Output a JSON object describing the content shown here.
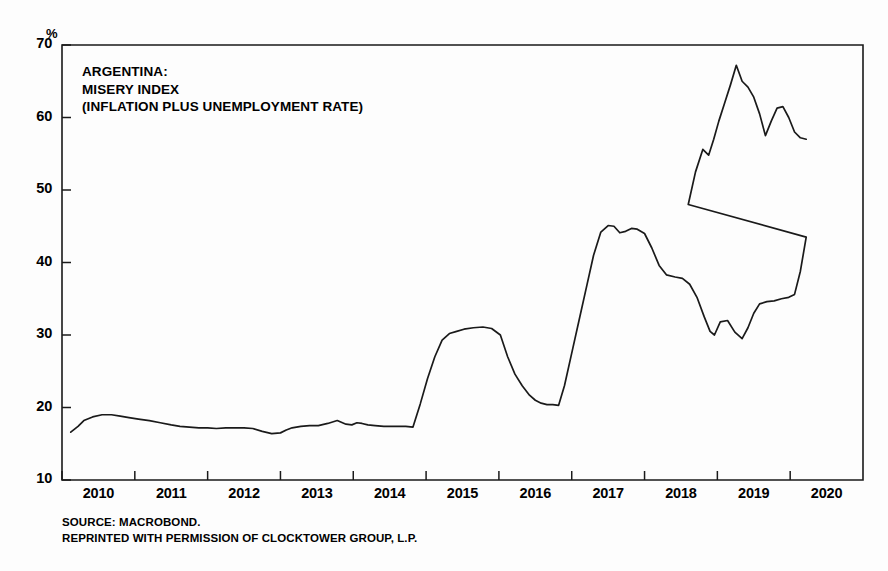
{
  "chart_data": {
    "type": "line",
    "title": "ARGENTINA: MISERY INDEX (INFLATION PLUS UNEMPLOYMENT RATE)",
    "title_lines": [
      "ARGENTINA:",
      "MISERY INDEX",
      "(INFLATION PLUS UNEMPLOYMENT RATE)"
    ],
    "xlabel": "",
    "ylabel": "%",
    "unit_label": "%",
    "xlim": [
      2009.5,
      2020.5
    ],
    "ylim": [
      10,
      70
    ],
    "grid": false,
    "legend": null,
    "line_color": "#1a1a1a",
    "ytick_labels": [
      "70",
      "60",
      "50",
      "40",
      "30",
      "20",
      "10"
    ],
    "ytick_values": [
      70,
      60,
      50,
      40,
      30,
      20,
      10
    ],
    "xtick_labels": [
      "2010",
      "2011",
      "2012",
      "2013",
      "2014",
      "2015",
      "2016",
      "2017",
      "2018",
      "2019",
      "2020"
    ],
    "xtick_values": [
      2010,
      2011,
      2012,
      2013,
      2014,
      2015,
      2016,
      2017,
      2018,
      2019,
      2020
    ],
    "series": [
      {
        "name": "Misery Index",
        "x": [
          2009.62,
          2009.72,
          2009.8,
          2009.92,
          2010.05,
          2010.18,
          2010.3,
          2010.42,
          2010.55,
          2010.7,
          2010.85,
          2011.0,
          2011.12,
          2011.25,
          2011.38,
          2011.5,
          2011.62,
          2011.75,
          2011.88,
          2012.0,
          2012.12,
          2012.25,
          2012.38,
          2012.5,
          2012.58,
          2012.66,
          2012.78,
          2012.9,
          2013.02,
          2013.15,
          2013.28,
          2013.4,
          2013.48,
          2013.55,
          2013.62,
          2013.7,
          2013.8,
          2013.92,
          2014.02,
          2014.12,
          2014.22,
          2014.32,
          2014.42,
          2014.52,
          2014.62,
          2014.72,
          2014.82,
          2014.92,
          2015.02,
          2015.15,
          2015.28,
          2015.4,
          2015.52,
          2015.62,
          2015.72,
          2015.82,
          2015.92,
          2016.0,
          2016.08,
          2016.16,
          2016.24,
          2016.32,
          2016.4,
          2016.5,
          2016.6,
          2016.7,
          2016.8,
          2016.9,
          2017.0,
          2017.08,
          2017.16,
          2017.24,
          2017.32,
          2017.4,
          2017.5,
          2017.6,
          2017.7,
          2017.8,
          2017.92,
          2018.02,
          2018.12,
          2018.22,
          2018.32,
          2018.4,
          2018.46,
          2018.54,
          2018.64,
          2018.74,
          2018.84,
          2018.92,
          2019.0,
          2019.08,
          2019.18,
          2019.28,
          2019.38,
          2019.48,
          2019.56,
          2019.64,
          2019.72
        ],
        "values": [
          16.6,
          17.4,
          18.2,
          18.7,
          19.0,
          19.0,
          18.8,
          18.6,
          18.4,
          18.2,
          17.9,
          17.6,
          17.4,
          17.3,
          17.2,
          17.2,
          17.1,
          17.2,
          17.2,
          17.2,
          17.1,
          16.7,
          16.4,
          16.5,
          16.9,
          17.2,
          17.4,
          17.5,
          17.5,
          17.8,
          18.2,
          17.7,
          17.6,
          17.9,
          17.8,
          17.6,
          17.5,
          17.4,
          17.4,
          17.4,
          17.4,
          17.3,
          20.5,
          24.0,
          27.0,
          29.3,
          30.2,
          30.5,
          30.8,
          31.0,
          31.1,
          30.9,
          30.0,
          27.0,
          24.6,
          23.0,
          21.7,
          21.0,
          20.6,
          20.4,
          20.4,
          20.3,
          23.0,
          27.5,
          32.0,
          36.5,
          41.0,
          44.2,
          45.1,
          45.0,
          44.1,
          44.3,
          44.7,
          44.6,
          44.0,
          42.0,
          39.6,
          38.3,
          38.0,
          37.8,
          37.0,
          35.2,
          32.5,
          30.5,
          30.0,
          31.8,
          32.0,
          30.4,
          29.5,
          31.0,
          33.0,
          34.3,
          34.6,
          34.7,
          35.0,
          35.2,
          35.6,
          38.8,
          43.5
        ]
      }
    ],
    "series_extra": {
      "name": "Misery Index (continued)",
      "x": [
        2018.0,
        2018.1,
        2018.2,
        2018.3,
        2018.38,
        2018.45,
        2018.52,
        2018.6,
        2018.68,
        2018.76,
        2018.84,
        2018.92,
        2019.0,
        2019.08,
        2019.16,
        2019.24,
        2019.32,
        2019.4,
        2019.48,
        2019.56,
        2019.64,
        2019.72
      ],
      "values": [
        43.5,
        48.0,
        52.5,
        55.6,
        54.8,
        57.0,
        59.5,
        62.0,
        64.5,
        67.2,
        65.0,
        64.2,
        62.8,
        60.5,
        57.5,
        59.5,
        61.3,
        61.5,
        60.0,
        58.0,
        57.2,
        57.0
      ]
    },
    "annotations": [
      "SOURCE: MACROBOND.",
      "REPRINTED WITH PERMISSION OF CLOCKTOWER GROUP, L.P."
    ]
  },
  "source": {
    "line1": "SOURCE: MACROBOND.",
    "line2": "REPRINTED WITH PERMISSION OF CLOCKTOWER GROUP, L.P."
  }
}
